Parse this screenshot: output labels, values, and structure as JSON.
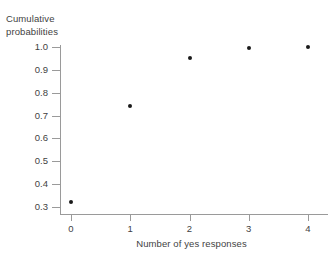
{
  "chart_data": {
    "type": "scatter",
    "title": "",
    "xlabel": "Number of yes responses",
    "ylabel": "Cumulative\nprobabilities",
    "x": [
      0,
      1,
      2,
      3,
      4
    ],
    "values": [
      0.32,
      0.74,
      0.95,
      0.997,
      1.0
    ],
    "categories": [
      "0",
      "1",
      "2",
      "3",
      "4"
    ],
    "xlim": [
      -0.2,
      4.35
    ],
    "ylim": [
      0.28,
      1.03
    ],
    "xticks": [
      "0",
      "1",
      "2",
      "3",
      "4"
    ],
    "yticks": [
      "0.3",
      "0.4",
      "0.5",
      "0.6",
      "0.7",
      "0.8",
      "0.9",
      "1.0"
    ],
    "ytick_values": [
      0.3,
      0.4,
      0.5,
      0.6,
      0.7,
      0.8,
      0.9,
      1.0
    ],
    "grid": false,
    "legend": null,
    "marker_color": "#1a1a1a",
    "axis_color": "#9a9a9a",
    "text_color": "#3f3f3f"
  }
}
